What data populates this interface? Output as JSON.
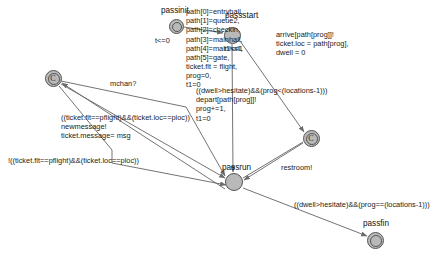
{
  "diagram": {
    "type": "timed-automaton",
    "colors": {
      "node_fill": "#b9b9b9",
      "node_stroke": "#555555",
      "edge_stroke": "#6b6b6b",
      "text": "#111111"
    }
  },
  "nodes": [
    {
      "id": "passinit",
      "label": "passinit",
      "x": 176,
      "y": 26,
      "r": 7.5,
      "kind": "initial",
      "mark": ""
    },
    {
      "id": "passstart",
      "label": "passstart",
      "x": 232,
      "y": 35,
      "r": 8.5,
      "kind": "normal",
      "mark": ""
    },
    {
      "id": "commit1",
      "label": "",
      "x": 53,
      "y": 78,
      "r": 8.5,
      "kind": "committed",
      "mark": "C"
    },
    {
      "id": "commit2",
      "label": "",
      "x": 311,
      "y": 138,
      "r": 8.5,
      "kind": "committed",
      "mark": "C"
    },
    {
      "id": "passrun",
      "label": "passrun",
      "x": 234,
      "y": 182,
      "r": 9.0,
      "kind": "normal",
      "mark": ""
    },
    {
      "id": "passfin",
      "label": "passfin",
      "x": 375,
      "y": 240,
      "r": 8.5,
      "kind": "normal",
      "mark": ""
    }
  ],
  "node_labels": {
    "passinit": "passinit",
    "passstart": "passstart",
    "passrun": "passrun",
    "passfin": "passfin"
  },
  "invariants": {
    "passinit": "t<=0",
    "passstart": "t1<=1"
  },
  "edge_labels": {
    "init_assign": "path[0]=entryhall,\npath[1]=queue2,\npath[2]=checkin,\npath[3]=mainhall,\npath[4]=mainhall,\npath[5]=gate,\nticket.flt = flight,\nprog=0,\nt1=0",
    "arrive": "arrive[path[prog]]!\nticket.loc = path[prog],\ndwell = 0",
    "depart": "((dwell>hesitate)&&(prog<(locations-1)))\ndepart[path[prog]]!\nprog+=1,\nt1=0",
    "mchan": "mchan?",
    "newmessage": "((ticket.flt==pflight)&&(ticket.loc==ploc))\nnewmessage!\nticket.message= msg",
    "nomessage": "!((ticket.flt==pflight)&&(ticket.loc==ploc))",
    "restroom": "restroom!",
    "finish": "((dwell>hesitate)&&(prog==(locations-1)))"
  },
  "edges": [
    {
      "id": "e-init-start",
      "from": "passinit",
      "to": "passstart",
      "label": "init_assign"
    },
    {
      "id": "e-start-commit2",
      "from": "passstart",
      "to": "commit2",
      "label": "arrive"
    },
    {
      "id": "e-start-passrun",
      "from": "passstart",
      "to": "passrun",
      "label": ""
    },
    {
      "id": "e-passrun-depart",
      "from": "passrun",
      "to": "commit2",
      "label": "depart"
    },
    {
      "id": "e-commit1-mchan",
      "from": "commit1",
      "to": "passrun",
      "label": "mchan"
    },
    {
      "id": "e-newmessage",
      "from": "commit1",
      "to": "passrun",
      "label": "newmessage"
    },
    {
      "id": "e-nomessage",
      "from": "commit1",
      "to": "passrun",
      "label": "nomessage"
    },
    {
      "id": "e-restroom",
      "from": "passrun",
      "to": "commit2",
      "label": "restroom"
    },
    {
      "id": "e-passfin",
      "from": "passrun",
      "to": "passfin",
      "label": "finish"
    }
  ]
}
